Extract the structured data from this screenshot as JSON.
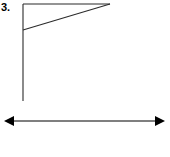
{
  "figure": {
    "label": "3.",
    "background_color": "#ffffff",
    "stroke_color": "#2b2b2b",
    "arrow_color": "#000000",
    "canvas": {
      "width": 170,
      "height": 157
    },
    "elements": {
      "vertical_leg": {
        "name": "vertical-leg",
        "x1": 23,
        "y1": 4,
        "x2": 23,
        "y2": 101,
        "stroke_width": 1.1
      },
      "horizontal_leg": {
        "name": "horizontal-top-leg",
        "x1": 23,
        "y1": 4,
        "x2": 110,
        "y2": 4,
        "stroke_width": 1.1
      },
      "hypotenuse": {
        "name": "hypotenuse",
        "x1": 23,
        "y1": 30,
        "x2": 110,
        "y2": 4,
        "stroke_width": 1.1
      },
      "double_arrow": {
        "name": "double-headed-arrow",
        "x1": 4,
        "y1": 121,
        "x2": 165,
        "y2": 121,
        "stroke_width": 1.2,
        "head_length": 10,
        "head_half_width": 5
      }
    }
  }
}
